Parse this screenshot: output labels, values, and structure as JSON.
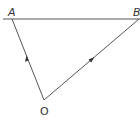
{
  "diagram": {
    "type": "vector-triangle",
    "points": {
      "A": {
        "label": "A",
        "x": 12,
        "y": 19
      },
      "B": {
        "label": "B",
        "x": 139,
        "y": 19
      },
      "O": {
        "label": "O",
        "x": 44,
        "y": 100
      }
    },
    "baseline": {
      "x1": 3,
      "y1": 19,
      "x2": 140,
      "y2": 19
    },
    "vectors": [
      {
        "name": "OA",
        "from": "O",
        "to": "A",
        "arrow_direction": "toward A"
      },
      {
        "name": "OB",
        "from": "O",
        "to": "B",
        "arrow_direction": "toward B"
      }
    ],
    "colors": {
      "line": "#555555",
      "label": "#333333",
      "background": "#ffffff"
    }
  }
}
